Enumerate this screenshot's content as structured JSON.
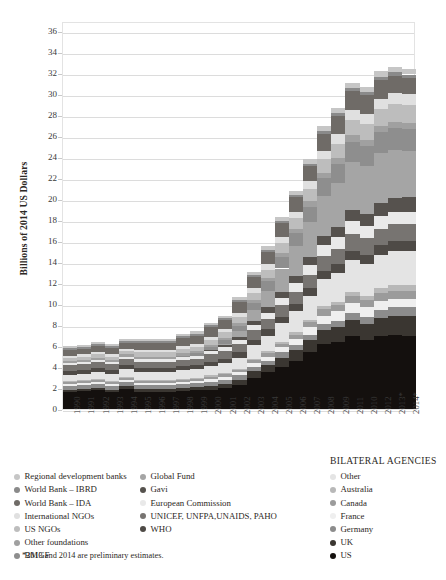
{
  "chart_data": {
    "type": "bar",
    "subtype": "stacked",
    "title": "",
    "xlabel": "",
    "ylabel": "Billions of 2014 US Dollars",
    "ylim": [
      0,
      37
    ],
    "ytick_step": 2,
    "yticks": [
      0,
      2,
      4,
      6,
      8,
      10,
      12,
      14,
      16,
      18,
      20,
      22,
      24,
      26,
      28,
      30,
      32,
      34,
      36
    ],
    "grid": true,
    "legend_position": "below",
    "categories": [
      "1990",
      "1991",
      "1992",
      "1993",
      "1994",
      "1995",
      "1996",
      "1997",
      "1998",
      "1999",
      "2000",
      "2001",
      "2002",
      "2003",
      "2004",
      "2005",
      "2006",
      "2007",
      "2008",
      "2009",
      "2011",
      "2010",
      "2012",
      "2013*",
      "2014*"
    ],
    "series": [
      {
        "name": "US",
        "color": "#14100e",
        "values": [
          1.6,
          1.7,
          1.8,
          1.6,
          1.9,
          1.6,
          1.6,
          1.6,
          1.7,
          1.8,
          1.8,
          2.0,
          2.3,
          3.0,
          3.5,
          4.0,
          4.6,
          5.4,
          6.2,
          6.4,
          7.0,
          6.6,
          7.0,
          7.1,
          7.0
        ]
      },
      {
        "name": "UK",
        "color": "#3a3631",
        "values": [
          0.2,
          0.2,
          0.2,
          0.2,
          0.3,
          0.3,
          0.3,
          0.3,
          0.3,
          0.3,
          0.4,
          0.4,
          0.5,
          0.6,
          0.7,
          0.9,
          1.0,
          1.2,
          1.3,
          1.4,
          1.5,
          1.5,
          1.7,
          1.8,
          1.9
        ]
      },
      {
        "name": "Germany",
        "color": "#8c8c8c",
        "values": [
          0.4,
          0.4,
          0.4,
          0.4,
          0.4,
          0.4,
          0.4,
          0.4,
          0.4,
          0.4,
          0.4,
          0.4,
          0.4,
          0.4,
          0.4,
          0.5,
          0.5,
          0.5,
          0.6,
          0.6,
          0.7,
          0.7,
          0.7,
          0.8,
          0.8
        ]
      },
      {
        "name": "France",
        "color": "#efefef",
        "values": [
          0.2,
          0.2,
          0.2,
          0.2,
          0.2,
          0.2,
          0.2,
          0.2,
          0.2,
          0.2,
          0.3,
          0.3,
          0.3,
          0.4,
          0.4,
          0.5,
          0.6,
          0.7,
          0.8,
          0.9,
          0.9,
          0.9,
          0.9,
          0.8,
          0.8
        ]
      },
      {
        "name": "Canada",
        "color": "#9b9b9b",
        "values": [
          0.2,
          0.2,
          0.2,
          0.2,
          0.2,
          0.2,
          0.2,
          0.2,
          0.2,
          0.2,
          0.2,
          0.2,
          0.2,
          0.3,
          0.3,
          0.3,
          0.4,
          0.5,
          0.6,
          0.6,
          0.7,
          0.7,
          0.8,
          0.8,
          0.8
        ]
      },
      {
        "name": "Australia",
        "color": "#b8b8b8",
        "values": [
          0.1,
          0.1,
          0.1,
          0.1,
          0.1,
          0.1,
          0.1,
          0.1,
          0.1,
          0.1,
          0.1,
          0.1,
          0.1,
          0.1,
          0.2,
          0.2,
          0.2,
          0.2,
          0.3,
          0.3,
          0.4,
          0.4,
          0.4,
          0.5,
          0.5
        ]
      },
      {
        "name": "Other",
        "color": "#e4e4e4",
        "values": [
          0.5,
          0.5,
          0.6,
          0.6,
          0.7,
          0.7,
          0.7,
          0.7,
          0.8,
          0.8,
          0.9,
          1.0,
          1.1,
          1.3,
          1.5,
          1.8,
          2.0,
          2.3,
          2.6,
          2.8,
          3.0,
          3.0,
          3.2,
          3.3,
          3.3
        ]
      },
      {
        "name": "WHO",
        "color": "#4e4a46",
        "values": [
          0.4,
          0.4,
          0.4,
          0.4,
          0.4,
          0.4,
          0.4,
          0.4,
          0.4,
          0.4,
          0.4,
          0.4,
          0.5,
          0.5,
          0.6,
          0.6,
          0.7,
          0.7,
          0.8,
          0.8,
          0.9,
          0.9,
          0.9,
          0.9,
          0.9
        ]
      },
      {
        "name": "UNICEF, UNFPA,UNAIDS, PAHO",
        "color": "#777471",
        "values": [
          0.6,
          0.6,
          0.6,
          0.6,
          0.6,
          0.6,
          0.6,
          0.6,
          0.6,
          0.6,
          0.7,
          0.7,
          0.8,
          0.9,
          1.0,
          1.1,
          1.2,
          1.3,
          1.4,
          1.5,
          1.6,
          1.6,
          1.6,
          1.6,
          1.6
        ]
      },
      {
        "name": "European Commission",
        "color": "#e9e9e9",
        "values": [
          0.2,
          0.2,
          0.2,
          0.2,
          0.2,
          0.3,
          0.3,
          0.3,
          0.3,
          0.3,
          0.3,
          0.4,
          0.4,
          0.5,
          0.6,
          0.7,
          0.8,
          0.9,
          1.0,
          1.1,
          1.2,
          1.2,
          1.2,
          1.2,
          1.2
        ]
      },
      {
        "name": "Gavi",
        "color": "#56524e",
        "values": [
          0,
          0,
          0,
          0,
          0,
          0,
          0,
          0,
          0,
          0,
          0.1,
          0.2,
          0.3,
          0.4,
          0.5,
          0.6,
          0.7,
          0.8,
          0.9,
          1.0,
          1.1,
          1.1,
          1.2,
          1.3,
          1.4
        ]
      },
      {
        "name": "Global Fund",
        "color": "#a5a5a5",
        "values": [
          0,
          0,
          0,
          0,
          0,
          0,
          0,
          0,
          0,
          0,
          0,
          0.1,
          0.5,
          1.0,
          1.6,
          2.2,
          2.8,
          3.3,
          3.8,
          4.2,
          4.6,
          4.6,
          4.8,
          4.6,
          4.4
        ]
      },
      {
        "name": "BMGF",
        "color": "#8e8e8e",
        "values": [
          0,
          0,
          0,
          0,
          0,
          0,
          0,
          0,
          0.1,
          0.2,
          0.3,
          0.4,
          0.5,
          0.7,
          0.9,
          1.1,
          1.3,
          1.5,
          1.7,
          1.8,
          1.9,
          1.9,
          2.0,
          2.1,
          2.1
        ]
      },
      {
        "name": "Other foundations",
        "color": "#a0a0a0",
        "values": [
          0.2,
          0.2,
          0.2,
          0.2,
          0.2,
          0.2,
          0.2,
          0.2,
          0.2,
          0.2,
          0.2,
          0.2,
          0.3,
          0.3,
          0.3,
          0.4,
          0.4,
          0.5,
          0.5,
          0.5,
          0.6,
          0.6,
          0.6,
          0.6,
          0.6
        ]
      },
      {
        "name": "US NGOs",
        "color": "#bdbdbd",
        "values": [
          0.3,
          0.3,
          0.3,
          0.3,
          0.3,
          0.4,
          0.4,
          0.4,
          0.4,
          0.4,
          0.5,
          0.5,
          0.6,
          0.7,
          0.8,
          0.9,
          1.0,
          1.2,
          1.3,
          1.4,
          1.5,
          1.5,
          1.6,
          1.7,
          1.7
        ]
      },
      {
        "name": "International NGOs",
        "color": "#e0e0e0",
        "values": [
          0.2,
          0.2,
          0.2,
          0.2,
          0.2,
          0.2,
          0.2,
          0.2,
          0.3,
          0.3,
          0.3,
          0.3,
          0.4,
          0.4,
          0.5,
          0.6,
          0.6,
          0.7,
          0.8,
          0.9,
          0.9,
          0.9,
          1.0,
          1.0,
          1.0
        ]
      },
      {
        "name": "World Bank – IDA",
        "color": "#6f6b67",
        "values": [
          0.5,
          0.5,
          0.6,
          0.6,
          0.6,
          0.7,
          0.7,
          0.7,
          0.8,
          0.8,
          0.9,
          0.9,
          1.0,
          1.1,
          1.2,
          1.3,
          1.4,
          1.5,
          1.6,
          1.7,
          1.8,
          1.8,
          1.8,
          1.7,
          1.6
        ]
      },
      {
        "name": "World Bank – IBRD",
        "color": "#8a8a8a",
        "values": [
          0.2,
          0.2,
          0.2,
          0.2,
          0.2,
          0.2,
          0.2,
          0.2,
          0.2,
          0.2,
          0.2,
          0.2,
          0.2,
          0.2,
          0.2,
          0.2,
          0.2,
          0.2,
          0.3,
          0.3,
          0.3,
          0.3,
          0.3,
          0.3,
          0.3
        ]
      },
      {
        "name": "Regional development banks",
        "color": "#c6c6c6",
        "values": [
          0.2,
          0.2,
          0.2,
          0.2,
          0.2,
          0.2,
          0.2,
          0.2,
          0.2,
          0.2,
          0.2,
          0.2,
          0.3,
          0.3,
          0.3,
          0.4,
          0.4,
          0.4,
          0.5,
          0.5,
          0.5,
          0.5,
          0.5,
          0.5,
          0.5
        ]
      }
    ]
  },
  "axis": {
    "y_title": "Billions of 2014 US Dollars"
  },
  "legend": {
    "col_a": {
      "heading": "",
      "items": [
        {
          "label": "Regional development banks",
          "color": "#c6c6c6"
        },
        {
          "label": "World Bank – IBRD",
          "color": "#8a8a8a"
        },
        {
          "label": "World Bank – IDA",
          "color": "#6f6b67"
        },
        {
          "label": "International NGOs",
          "color": "#e0e0e0"
        },
        {
          "label": "US NGOs",
          "color": "#bdbdbd"
        },
        {
          "label": "Other foundations",
          "color": "#a0a0a0"
        },
        {
          "label": "BMGF",
          "color": "#8e8e8e"
        }
      ]
    },
    "col_b": {
      "heading": "",
      "items": [
        {
          "label": "Global Fund",
          "color": "#a5a5a5"
        },
        {
          "label": "Gavi",
          "color": "#56524e"
        },
        {
          "label": "European Commission",
          "color": "#e9e9e9"
        },
        {
          "label": "UNICEF, UNFPA,UNAIDS, PAHO",
          "color": "#777471"
        },
        {
          "label": "WHO",
          "color": "#4e4a46"
        }
      ]
    },
    "col_c": {
      "heading": "BILATERAL AGENCIES",
      "items": [
        {
          "label": "Other",
          "color": "#e4e4e4"
        },
        {
          "label": "Australia",
          "color": "#b8b8b8"
        },
        {
          "label": "Canada",
          "color": "#9b9b9b"
        },
        {
          "label": "France",
          "color": "#efefef"
        },
        {
          "label": "Germany",
          "color": "#8c8c8c"
        },
        {
          "label": "UK",
          "color": "#3a3631"
        },
        {
          "label": "US",
          "color": "#14100e"
        }
      ]
    }
  },
  "footnote": "*2013 and 2014 are preliminary estimates."
}
